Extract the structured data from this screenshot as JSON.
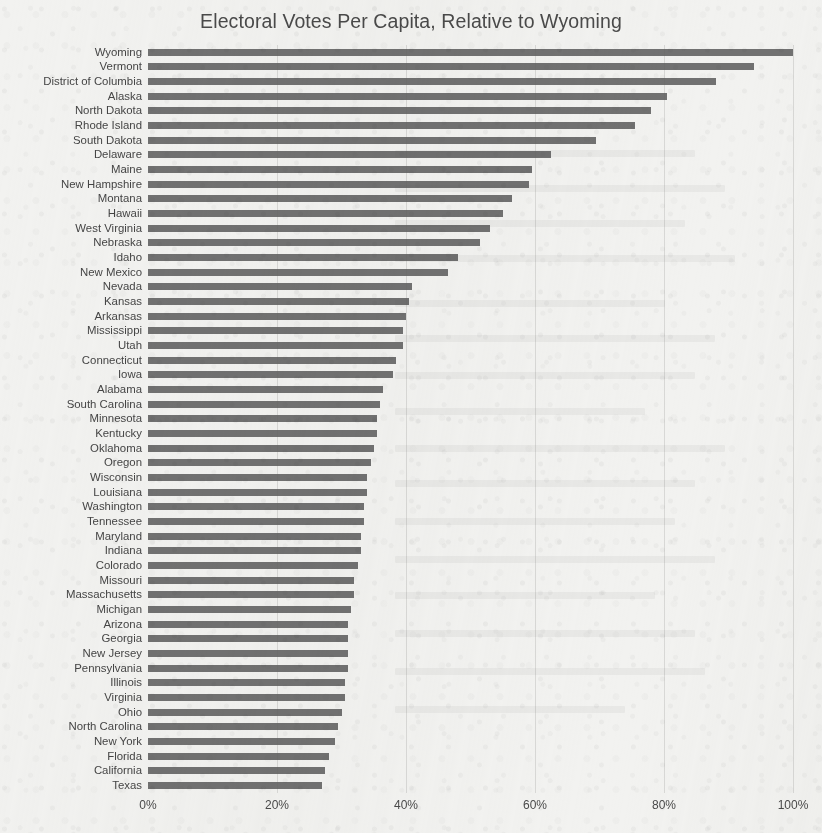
{
  "chart": {
    "title": "Electoral Votes Per Capita, Relative to Wyoming",
    "axis": {
      "x_ticks": [
        "0%",
        "20%",
        "40%",
        "60%",
        "80%",
        "100%"
      ],
      "x_tick_values": [
        0,
        20,
        40,
        60,
        80,
        100
      ]
    }
  },
  "chart_data": {
    "type": "bar",
    "orientation": "horizontal",
    "title": "Electoral Votes Per Capita, Relative to Wyoming",
    "xlabel": "",
    "ylabel": "",
    "xlim": [
      0,
      100
    ],
    "grid": true,
    "grid_axis": "x",
    "legend": null,
    "units": "percent of Wyoming's electoral votes per capita",
    "bar_color": "#5e5e5e",
    "background_color": "#f2f2f0",
    "categories": [
      "Wyoming",
      "Vermont",
      "District of Columbia",
      "Alaska",
      "North Dakota",
      "Rhode Island",
      "South Dakota",
      "Delaware",
      "Maine",
      "New Hampshire",
      "Montana",
      "Hawaii",
      "West Virginia",
      "Nebraska",
      "Idaho",
      "New Mexico",
      "Nevada",
      "Kansas",
      "Arkansas",
      "Mississippi",
      "Utah",
      "Connecticut",
      "Iowa",
      "Alabama",
      "South Carolina",
      "Minnesota",
      "Kentucky",
      "Oklahoma",
      "Oregon",
      "Wisconsin",
      "Louisiana",
      "Washington",
      "Tennessee",
      "Maryland",
      "Indiana",
      "Colorado",
      "Missouri",
      "Massachusetts",
      "Michigan",
      "Arizona",
      "Georgia",
      "New Jersey",
      "Pennsylvania",
      "Illinois",
      "Virginia",
      "Ohio",
      "North Carolina",
      "New York",
      "Florida",
      "California",
      "Texas"
    ],
    "values": [
      100.0,
      94.0,
      88.0,
      80.5,
      78.0,
      75.5,
      69.5,
      62.5,
      59.5,
      59.0,
      56.5,
      55.0,
      53.0,
      51.5,
      48.0,
      46.5,
      41.0,
      40.5,
      40.0,
      39.5,
      39.5,
      38.5,
      38.0,
      36.5,
      36.0,
      35.5,
      35.5,
      35.0,
      34.5,
      34.0,
      34.0,
      33.5,
      33.5,
      33.0,
      33.0,
      32.5,
      32.0,
      32.0,
      31.5,
      31.0,
      31.0,
      31.0,
      31.0,
      30.5,
      30.5,
      30.0,
      29.5,
      29.0,
      28.0,
      27.5,
      27.0
    ]
  }
}
